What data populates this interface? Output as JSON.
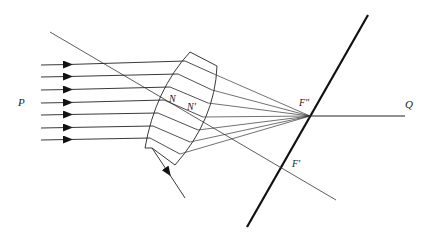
{
  "diagram": {
    "type": "optics-ray-diagram",
    "labels": {
      "P": "P",
      "N": "N",
      "N_prime": "N'",
      "F_double_prime": "F\"",
      "F_prime": "F'",
      "Q": "Q"
    },
    "colors": {
      "stroke": "#2a2a2a",
      "thick_plane": "#111111",
      "background": "#ffffff"
    },
    "incident_rays_count": 7
  }
}
